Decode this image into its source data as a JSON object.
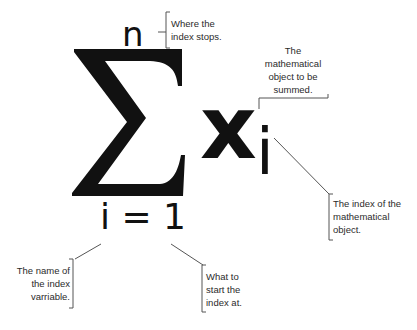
{
  "formula": {
    "operator": "Σ",
    "upper_limit": "n",
    "lower_limit": "i = 1",
    "term_variable": "x",
    "term_subscript": "i"
  },
  "annotations": {
    "upper_limit": {
      "lines": [
        "Where the",
        "index stops."
      ]
    },
    "summand": {
      "lines": [
        "The",
        "mathematical",
        "object to be",
        "summed."
      ]
    },
    "subscript": {
      "lines": [
        "The index of the",
        "mathematical",
        "object."
      ]
    },
    "index_name": {
      "lines": [
        "The name of",
        "the index",
        "varriable."
      ]
    },
    "index_start": {
      "lines": [
        "What to",
        "start the",
        "index at."
      ]
    }
  },
  "colors": {
    "ink": "#111111",
    "annotation_text": "#2b2b2b",
    "leader_line": "#555555",
    "background": "#ffffff"
  }
}
